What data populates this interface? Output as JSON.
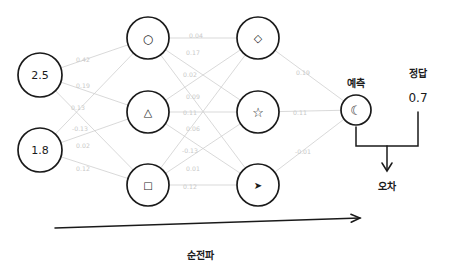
{
  "diagram": {
    "title_hidden": "",
    "bottom_label": "순전파",
    "prediction_label": "예측",
    "answer_label": "정답",
    "answer_value": "0.7",
    "error_label": "오차",
    "colors": {
      "ink": "#1a1a1a",
      "edge": "#cfcfcf",
      "weight_text": "#c9c9c9",
      "background": "#ffffff"
    },
    "input_layer": {
      "name": "input-layer",
      "nodes": [
        {
          "id": "in1",
          "value": "2.5",
          "cx": 40,
          "cy": 75,
          "r": 22
        },
        {
          "id": "in2",
          "value": "1.8",
          "cx": 40,
          "cy": 150,
          "r": 22
        }
      ]
    },
    "hidden_layer_1": {
      "name": "hidden-layer-1",
      "nodes": [
        {
          "id": "h1",
          "glyph": "○",
          "glyph_name": "circle-glyph",
          "cx": 148,
          "cy": 38,
          "r": 21,
          "size": 12
        },
        {
          "id": "h2",
          "glyph": "△",
          "glyph_name": "triangle-glyph",
          "cx": 148,
          "cy": 112,
          "r": 21,
          "size": 11
        },
        {
          "id": "h3",
          "glyph": "□",
          "glyph_name": "square-glyph",
          "cx": 148,
          "cy": 185,
          "r": 21,
          "size": 10
        }
      ]
    },
    "hidden_layer_2": {
      "name": "hidden-layer-2",
      "nodes": [
        {
          "id": "g1",
          "glyph": "◇",
          "glyph_name": "diamond-glyph",
          "cx": 258,
          "cy": 38,
          "r": 21,
          "size": 11
        },
        {
          "id": "g2",
          "glyph": "☆",
          "glyph_name": "star-glyph",
          "cx": 258,
          "cy": 112,
          "r": 21,
          "size": 13
        },
        {
          "id": "g3",
          "glyph": "➤",
          "glyph_name": "pointer-glyph",
          "cx": 258,
          "cy": 185,
          "r": 21,
          "size": 10
        }
      ]
    },
    "output_layer": {
      "name": "output-layer",
      "nodes": [
        {
          "id": "out1",
          "glyph": "☾",
          "glyph_name": "moon-glyph",
          "cx": 356,
          "cy": 110,
          "r": 15,
          "size": 13
        }
      ]
    },
    "weights_input_to_hidden1": [
      {
        "from": "in1",
        "to": "h1",
        "value": "0.42",
        "x": 83,
        "y": 59
      },
      {
        "from": "in1",
        "to": "h2",
        "value": "0.19",
        "x": 83,
        "y": 85
      },
      {
        "from": "in1",
        "to": "h3",
        "value": "0.13",
        "x": 78,
        "y": 107
      },
      {
        "from": "in2",
        "to": "h1",
        "value": "-0.13",
        "x": 80,
        "y": 128
      },
      {
        "from": "in2",
        "to": "h2",
        "value": "0.02",
        "x": 83,
        "y": 145
      },
      {
        "from": "in2",
        "to": "h3",
        "value": "0.12",
        "x": 83,
        "y": 168
      }
    ],
    "weights_hidden1_to_hidden2": [
      {
        "from": "h1",
        "to": "g1",
        "value": "0.04",
        "x": 196,
        "y": 35
      },
      {
        "from": "h1",
        "to": "g2",
        "value": "0.17",
        "x": 193,
        "y": 52
      },
      {
        "from": "h1",
        "to": "g3",
        "value": "0.02",
        "x": 190,
        "y": 74
      },
      {
        "from": "h2",
        "to": "g1",
        "value": "0.09",
        "x": 193,
        "y": 96
      },
      {
        "from": "h2",
        "to": "g2",
        "value": "0.11",
        "x": 190,
        "y": 112
      },
      {
        "from": "h2",
        "to": "g3",
        "value": "0.06",
        "x": 193,
        "y": 128
      },
      {
        "from": "h3",
        "to": "g1",
        "value": "-0.13",
        "x": 190,
        "y": 150
      },
      {
        "from": "h3",
        "to": "g2",
        "value": "0.01",
        "x": 193,
        "y": 168
      },
      {
        "from": "h3",
        "to": "g3",
        "value": "0.12",
        "x": 190,
        "y": 186
      }
    ],
    "weights_hidden2_to_output": [
      {
        "from": "g1",
        "to": "out1",
        "value": "0.19",
        "x": 303,
        "y": 72
      },
      {
        "from": "g2",
        "to": "out1",
        "value": "0.11",
        "x": 300,
        "y": 112
      },
      {
        "from": "g3",
        "to": "out1",
        "value": "-0.01",
        "x": 303,
        "y": 151
      }
    ],
    "flow_arrow": {
      "name": "forward-flow-arrow",
      "x1": 55,
      "y1": 228,
      "x2": 360,
      "y2": 218
    }
  }
}
